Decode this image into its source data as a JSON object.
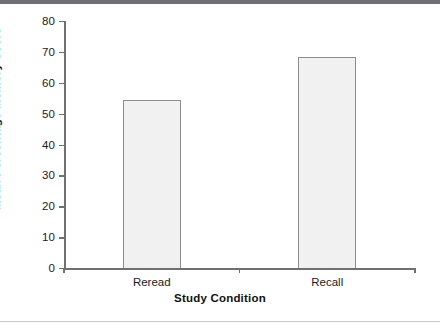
{
  "figure": {
    "background_color": "#ffffff",
    "top_rule_color": "#6f7073",
    "bottom_rule_color": "#c8c9cc"
  },
  "chart_data": {
    "type": "bar",
    "title": "",
    "subtitle": "",
    "categories": [
      "Reread",
      "Recall"
    ],
    "values": [
      54.3,
      68.3
    ],
    "xlabel": "Study Condition",
    "ylabel": "Mean Percentage Memory Score",
    "ylim": [
      0,
      80
    ],
    "yticks": [
      0,
      10,
      20,
      30,
      40,
      50,
      60,
      70,
      80
    ],
    "ytick_labels": [
      "0",
      "10",
      "20",
      "30",
      "40",
      "50",
      "60",
      "70",
      "80"
    ],
    "grid": false,
    "legend": null,
    "annotations": [],
    "bar_fill_color": "#f1f1f1",
    "bar_edge_color": "#8b8c8f",
    "axis_color": "#6f7073"
  }
}
